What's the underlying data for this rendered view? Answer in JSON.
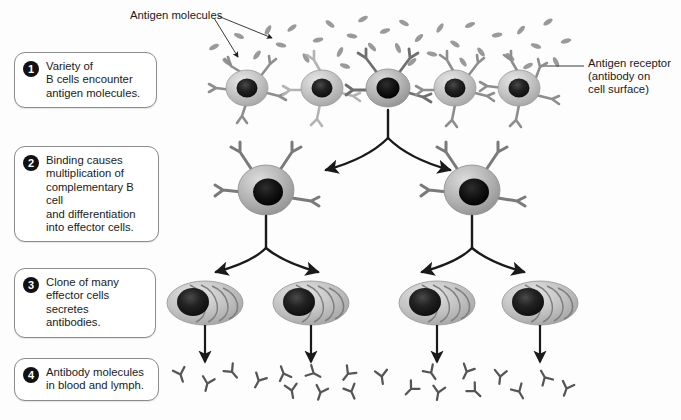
{
  "diagram": {
    "background_color": "#fdfdfd",
    "cell_body_color": "#b9b9b9",
    "nucleus_color": "#2b2b2b",
    "receptor_color": "#8e8e8e",
    "antigen_color": "#9a9a9a",
    "arrow_color": "#1a1a1a",
    "badge_color": "#111111",
    "box_border_color": "#8c8c8c"
  },
  "steps": [
    {
      "number": "1",
      "text": "Variety of\nB cells encounter\nantigen molecules."
    },
    {
      "number": "2",
      "text": "Binding causes\nmultiplication of\ncomplementary B cell\nand differentiation\ninto effector cells."
    },
    {
      "number": "3",
      "text": "Clone of many\neffector cells\nsecretes antibodies."
    },
    {
      "number": "4",
      "text": "Antibody molecules\nin blood and lymph."
    }
  ],
  "labels": {
    "antigen_molecules": "Antigen molecules",
    "antigen_receptor": "Antigen receptor\n(antibody on\ncell surface)"
  },
  "rows": {
    "b_cells": {
      "count": 5,
      "selected_index": 2,
      "x_positions": [
        247,
        322,
        388,
        455,
        519
      ],
      "y": 88
    },
    "effector_parents": {
      "count": 2,
      "x_positions": [
        266,
        472
      ],
      "y": 190
    },
    "clones": {
      "count": 4,
      "x_positions": [
        205,
        311,
        437,
        540
      ],
      "y": 303,
      "cells_per_clone": 5
    },
    "antibodies": {
      "count": 16,
      "y_range": [
        368,
        398
      ]
    }
  }
}
